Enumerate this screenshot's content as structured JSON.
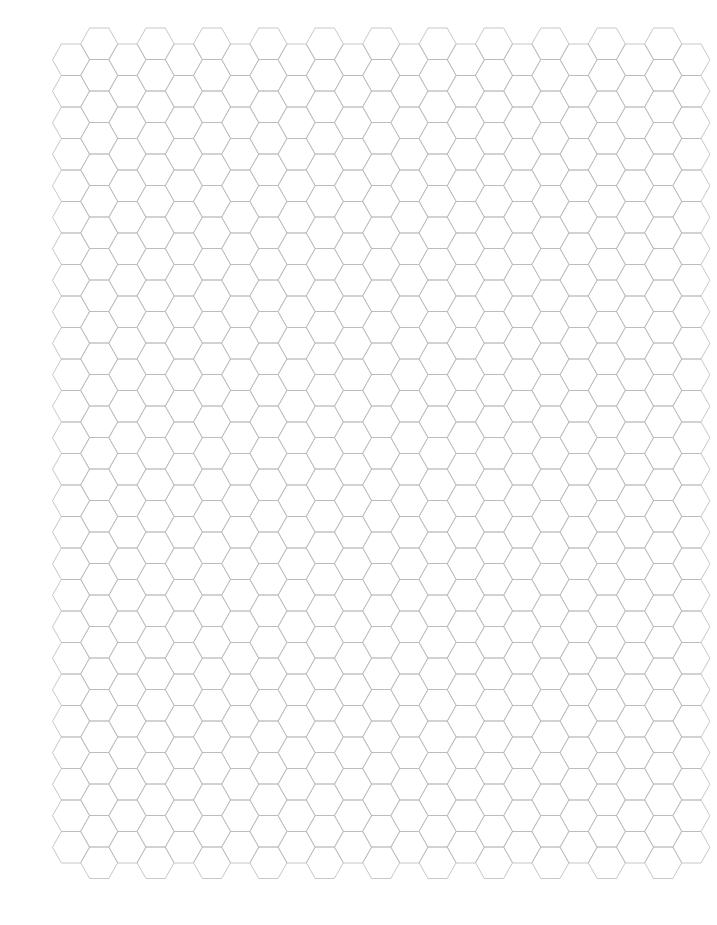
{
  "document": {
    "kind": "hexagonal graph paper",
    "page": {
      "width": 717,
      "height": 925,
      "background": "#ffffff"
    }
  },
  "grid": {
    "orientation": "flat-top",
    "line_color": "#b9b9b9",
    "columns": 23,
    "column_spacing": 28.2,
    "first_column_center_x": 71,
    "hex_width": 37,
    "hex_top_edge_inset": 8.9,
    "hex_height": 31.5,
    "low_columns": {
      "parity": "even",
      "hex_count": 26,
      "top_y": 44
    },
    "high_columns": {
      "parity": "odd",
      "hex_count": 27,
      "top_y": 28
    }
  }
}
